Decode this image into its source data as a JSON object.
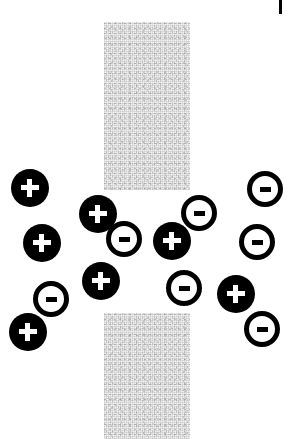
{
  "figure": {
    "width": 294,
    "height": 439,
    "background_color": "#ffffff",
    "ion_color_positive": "#000000",
    "ion_color_negative": "#000000",
    "ion_fill_positive": "#000000",
    "ion_fill_negative": "#ffffff",
    "membrane_color": "#f2f2f2",
    "membrane_texture": "stippled-gray-noise"
  },
  "membrane": {
    "label": "membrane-slab",
    "slabs": [
      {
        "name": "upper-membrane-slab",
        "x": 104,
        "y": 22,
        "width": 86,
        "height": 168
      },
      {
        "name": "lower-membrane-slab",
        "x": 104,
        "y": 313,
        "width": 86,
        "height": 126
      }
    ],
    "pore_gap": {
      "x": 104,
      "y": 190,
      "width": 86,
      "height": 123
    }
  },
  "tick": {
    "name": "corner-tick-mark",
    "x": 279,
    "y": 0,
    "width": 3,
    "height": 14,
    "color": "#000000"
  },
  "ions": [
    {
      "id": 1,
      "charge": "+",
      "sign": "+",
      "type": "cation",
      "cx": 30,
      "cy": 188,
      "r": 19
    },
    {
      "id": 2,
      "charge": "+",
      "sign": "+",
      "type": "cation",
      "cx": 98,
      "cy": 214,
      "r": 19
    },
    {
      "id": 3,
      "charge": "-",
      "sign": "–",
      "type": "anion",
      "cx": 124,
      "cy": 239,
      "r": 18
    },
    {
      "id": 4,
      "charge": "+",
      "sign": "+",
      "type": "cation",
      "cx": 42,
      "cy": 243,
      "r": 19
    },
    {
      "id": 5,
      "charge": "+",
      "sign": "+",
      "type": "cation",
      "cx": 172,
      "cy": 241,
      "r": 19
    },
    {
      "id": 6,
      "charge": "-",
      "sign": "–",
      "type": "anion",
      "cx": 199,
      "cy": 213,
      "r": 18
    },
    {
      "id": 7,
      "charge": "-",
      "sign": "–",
      "type": "anion",
      "cx": 265,
      "cy": 189,
      "r": 18
    },
    {
      "id": 8,
      "charge": "-",
      "sign": "–",
      "type": "anion",
      "cx": 257,
      "cy": 242,
      "r": 18
    },
    {
      "id": 9,
      "charge": "+",
      "sign": "+",
      "type": "cation",
      "cx": 101,
      "cy": 281,
      "r": 19
    },
    {
      "id": 10,
      "charge": "-",
      "sign": "–",
      "type": "anion",
      "cx": 184,
      "cy": 288,
      "r": 18
    },
    {
      "id": 11,
      "charge": "+",
      "sign": "+",
      "type": "cation",
      "cx": 236,
      "cy": 294,
      "r": 19
    },
    {
      "id": 12,
      "charge": "-",
      "sign": "–",
      "type": "anion",
      "cx": 51,
      "cy": 299,
      "r": 18
    },
    {
      "id": 13,
      "charge": "+",
      "sign": "+",
      "type": "cation",
      "cx": 28,
      "cy": 332,
      "r": 19
    },
    {
      "id": 14,
      "charge": "-",
      "sign": "–",
      "type": "anion",
      "cx": 262,
      "cy": 329,
      "r": 18
    }
  ],
  "legend": {
    "positive_label": "+",
    "negative_label": "–",
    "positive_description": "positive ion (cation)",
    "negative_description": "negative ion (anion)"
  }
}
